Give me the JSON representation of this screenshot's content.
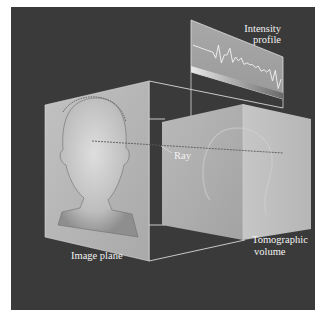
{
  "figure": {
    "background_color": "#3a3a3a",
    "plane_color": "#b4b4b4",
    "edge_color": "#e6e6e6"
  },
  "labels": {
    "intensity_profile_line1": "Intensity",
    "intensity_profile_line2": "profile",
    "ray": "Ray",
    "image_plane": "Image plane",
    "tomographic_volume_line1": "Tomographic",
    "tomographic_volume_line2": "volume"
  },
  "intensity_profile": {
    "description": "Intensity values sampled along the ray through the tomographic volume",
    "samples": [
      0.45,
      0.45,
      0.46,
      0.46,
      0.47,
      0.47,
      0.48,
      0.48,
      0.3,
      0.85,
      0.2,
      0.55,
      0.6,
      0.9,
      0.4,
      0.65,
      0.55,
      0.7,
      0.5,
      0.6,
      0.58,
      0.62,
      0.55,
      0.65,
      0.5,
      0.6,
      0.55,
      0.7,
      0.3,
      0.75,
      0.1,
      0.5
    ]
  }
}
